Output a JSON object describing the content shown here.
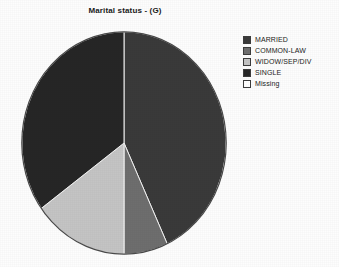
{
  "chart_data": {
    "type": "pie",
    "title": "Marital status - (G)",
    "xlabel": "",
    "ylabel": "",
    "legend_position": "right",
    "grid": false,
    "categories": [
      "MARRIED",
      "COMMON-LAW",
      "WIDOW/SEP/DIV",
      "SINGLE",
      "Missing"
    ],
    "values": [
      43,
      7,
      15,
      35,
      0
    ],
    "colors": [
      "#3a3a3a",
      "#6e6e6e",
      "#c4c4c4",
      "#262626",
      "#ffffff"
    ],
    "start_angle_deg": 0,
    "direction": "clockwise",
    "slices": [
      {
        "label": "MARRIED",
        "value": 43,
        "color": "#3a3a3a",
        "start_deg": 0,
        "end_deg": 155
      },
      {
        "label": "COMMON-LAW",
        "value": 7,
        "color": "#6e6e6e",
        "start_deg": 155,
        "end_deg": 180
      },
      {
        "label": "WIDOW/SEP/DIV",
        "value": 15,
        "color": "#c4c4c4",
        "start_deg": 180,
        "end_deg": 234
      },
      {
        "label": "SINGLE",
        "value": 35,
        "color": "#262626",
        "start_deg": 234,
        "end_deg": 360
      },
      {
        "label": "Missing",
        "value": 0,
        "color": "#ffffff",
        "start_deg": 360,
        "end_deg": 360
      }
    ]
  },
  "title": {
    "text": "Marital status - (G)"
  },
  "legend": {
    "items": [
      {
        "label": "MARRIED",
        "color": "#3a3a3a"
      },
      {
        "label": "COMMON-LAW",
        "color": "#6e6e6e"
      },
      {
        "label": "WIDOW/SEP/DIV",
        "color": "#c4c4c4"
      },
      {
        "label": "SINGLE",
        "color": "#262626"
      },
      {
        "label": "Missing",
        "color": "#ffffff"
      }
    ]
  }
}
